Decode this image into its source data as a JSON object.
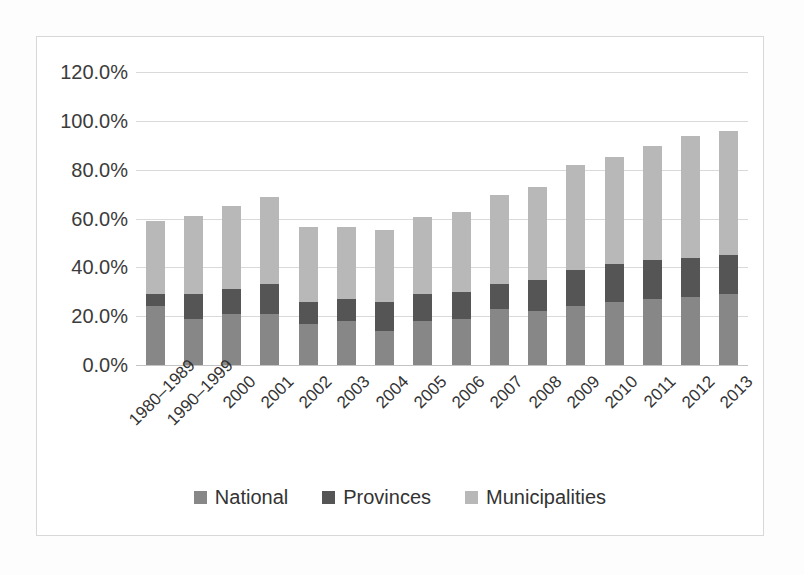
{
  "chart_data": {
    "type": "bar",
    "subtype": "stacked-bar",
    "title": "",
    "subtitle": "",
    "xlabel": "",
    "ylabel": "",
    "ylim": [
      0,
      120
    ],
    "ytick_values": [
      0,
      20,
      40,
      60,
      80,
      100,
      120
    ],
    "ytick_labels": [
      "0.0%",
      "20.0%",
      "40.0%",
      "60.0%",
      "80.0%",
      "100.0%",
      "120.0%"
    ],
    "grid": true,
    "legend_position": "bottom",
    "categories": [
      "1980–1989",
      "1990–1999",
      "2000",
      "2001",
      "2002",
      "2003",
      "2004",
      "2005",
      "2006",
      "2007",
      "2008",
      "2009",
      "2010",
      "2011",
      "2012",
      "2013"
    ],
    "series": [
      {
        "name": "National",
        "color": "#878787",
        "values": [
          24.0,
          19.0,
          21.0,
          21.0,
          17.0,
          18.0,
          14.0,
          18.0,
          19.0,
          23.0,
          22.0,
          24.0,
          26.0,
          27.0,
          28.0,
          29.0
        ]
      },
      {
        "name": "Provinces",
        "color": "#555555",
        "values": [
          5.0,
          10.0,
          10.0,
          12.0,
          9.0,
          9.0,
          12.0,
          11.0,
          11.0,
          10.0,
          13.0,
          15.0,
          15.5,
          16.0,
          16.0,
          16.0
        ]
      },
      {
        "name": "Municipalities",
        "color": "#b8b8b8",
        "values": [
          30.0,
          32.0,
          34.0,
          36.0,
          30.5,
          29.5,
          29.5,
          31.5,
          32.5,
          36.5,
          38.0,
          43.0,
          43.5,
          46.5,
          50.0,
          51.0
        ]
      }
    ],
    "totals": [
      59.0,
      61.0,
      65.0,
      69.0,
      56.5,
      56.5,
      55.5,
      60.5,
      62.5,
      69.5,
      73.0,
      82.0,
      85.0,
      89.5,
      94.0,
      96.0
    ]
  },
  "legend": {
    "entries": [
      {
        "label": "National",
        "color": "#878787"
      },
      {
        "label": "Provinces",
        "color": "#555555"
      },
      {
        "label": "Municipalities",
        "color": "#b8b8b8"
      }
    ]
  },
  "colors": {
    "national": "#878787",
    "provinces": "#555555",
    "municipalities": "#b8b8b8",
    "gridline": "#d9d9d9",
    "frame": "#d8d8d8",
    "text": "#333333",
    "background": "#ffffff"
  }
}
